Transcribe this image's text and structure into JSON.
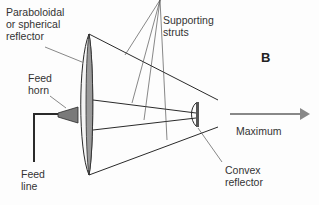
{
  "diagram": {
    "panel_letter": "B",
    "labels": {
      "reflector": "Paraboloidal\nor spherical\nreflector",
      "struts": "Supporting\nstruts",
      "feed_horn": "Feed\nhorn",
      "feed_line": "Feed\nline",
      "convex": "Convex\nreflector",
      "maximum": "Maximum"
    },
    "colors": {
      "line": "#2a2a2a",
      "reflector_fill": "#9a9a9a",
      "arrow": "#888888"
    }
  }
}
